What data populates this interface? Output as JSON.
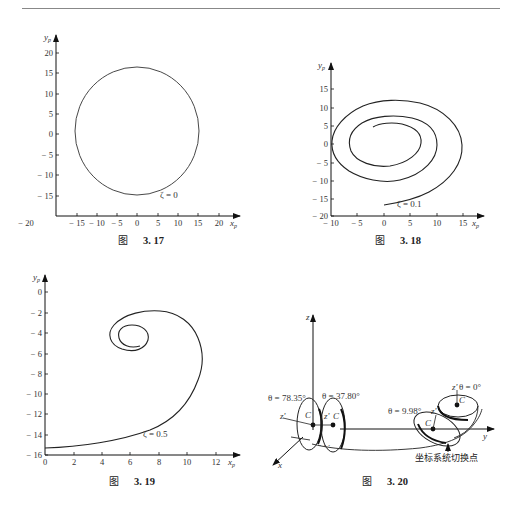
{
  "page": {
    "header_text": "",
    "figures": [
      {
        "id": "fig-3-17",
        "caption_prefix": "图",
        "caption_number": "3. 17"
      },
      {
        "id": "fig-3-18",
        "caption_prefix": "图",
        "caption_number": "3. 18"
      },
      {
        "id": "fig-3-19",
        "caption_prefix": "图",
        "caption_number": "3. 19"
      },
      {
        "id": "fig-3-20",
        "caption_prefix": "图",
        "caption_number": "3. 20"
      }
    ]
  },
  "chart_data": [
    {
      "type": "line",
      "title": "图 3.17",
      "xlabel": "x_p",
      "ylabel": "y_p",
      "annotation": "ζ = 0",
      "xlim": [
        -20,
        22
      ],
      "ylim": [
        -20,
        22
      ],
      "x_ticks": [
        "-20",
        "-15",
        "-10",
        "-5",
        "0",
        "5",
        "10",
        "15",
        "20"
      ],
      "y_ticks": [
        "20",
        "15",
        "10",
        "5",
        "0",
        "-5",
        "-10",
        "-15"
      ],
      "grid": false,
      "series": [
        {
          "name": "ζ=0",
          "shape": "closed circle",
          "center": [
            0,
            1
          ],
          "radius_x": 15.2,
          "radius_y": 15.6,
          "x": [
            0,
            10.7,
            15,
            10.7,
            0,
            -10.7,
            -15.2,
            -10.7,
            0
          ],
          "y": [
            16.5,
            12,
            1,
            -10.5,
            -14.5,
            -10.5,
            1,
            12,
            16.5
          ]
        }
      ]
    },
    {
      "type": "line",
      "title": "图 3.18",
      "xlabel": "x_p",
      "ylabel": "y_p",
      "annotation": "ζ = 0.1",
      "xlim": [
        -10,
        17
      ],
      "ylim": [
        -20,
        18
      ],
      "x_ticks": [
        "-10",
        "-5",
        "0",
        "5",
        "10",
        "15"
      ],
      "y_ticks": [
        "15",
        "10",
        "5",
        "0",
        "-5",
        "-10",
        "-15",
        "-20"
      ],
      "grid": false,
      "series": [
        {
          "name": "ζ=0.1",
          "shape": "outward spiral",
          "x": [
            -2,
            1.5,
            6,
            7,
            5,
            0.5,
            -4,
            -6.5,
            -5,
            0,
            5,
            9,
            10,
            7,
            0.5,
            -6.5,
            -10,
            -9,
            -2,
            2,
            9,
            14,
            15,
            12,
            5,
            0.5
          ],
          "y": [
            4.5,
            5.5,
            3,
            0,
            -4,
            -6,
            -5,
            0.5,
            4.5,
            7.5,
            7,
            4,
            0,
            -5.5,
            -9.5,
            -7.5,
            0,
            5,
            10.5,
            12,
            10.5,
            5,
            -2,
            -9,
            -13.5,
            -15
          ]
        }
      ]
    },
    {
      "type": "line",
      "title": "图 3.19",
      "xlabel": "x_p",
      "ylabel": "y_p",
      "annotation": "ζ = 0.5",
      "xlim": [
        0,
        13
      ],
      "ylim": [
        -16,
        1
      ],
      "x_ticks": [
        "0",
        "2",
        "4",
        "6",
        "8",
        "10",
        "12"
      ],
      "y_ticks": [
        "0",
        "-2",
        "-4",
        "-6",
        "-8",
        "-10",
        "-12",
        "-14",
        "-16"
      ],
      "grid": false,
      "series": [
        {
          "name": "ζ=0.5",
          "shape": "converging spiral",
          "x": [
            0,
            3,
            6,
            8,
            9.5,
            10.5,
            11,
            10.8,
            10,
            8,
            6,
            4.5,
            4.6,
            5.5,
            6.5,
            7,
            6,
            5.2,
            5.4,
            6.2,
            7.2,
            7.1,
            6.2
          ],
          "y": [
            -15.3,
            -15,
            -14.3,
            -13,
            -11.2,
            -8.8,
            -6.5,
            -4.8,
            -3.3,
            -2,
            -2.1,
            -3.7,
            -5,
            -5.6,
            -5.6,
            -4.5,
            -3.5,
            -4,
            -5.2,
            -5.5,
            -4.8,
            -3.9,
            -3.4
          ]
        }
      ]
    },
    {
      "type": "diagram",
      "title": "图 3.20",
      "axes": [
        "x",
        "y",
        "z"
      ],
      "annotations": [
        {
          "label": "θ = 78.35°"
        },
        {
          "label": "θ = 37.80°"
        },
        {
          "label": "θ = 9.98°"
        },
        {
          "label": "θ = 0°"
        },
        {
          "label": "z'"
        },
        {
          "label": "C"
        },
        {
          "label": "坐标系统切换点"
        }
      ]
    }
  ],
  "fig17": {
    "xlabel": "x",
    "xsub": "p",
    "ylabel": "y",
    "ysub": "p",
    "zeta": "ζ = 0",
    "xticks": [
      {
        "v": "− 20",
        "x": 26
      },
      {
        "v": "− 15",
        "x": 77
      },
      {
        "v": "− 10",
        "x": 97
      },
      {
        "v": "− 5",
        "x": 117
      },
      {
        "v": "0",
        "x": 137
      },
      {
        "v": "5",
        "x": 158
      },
      {
        "v": "10",
        "x": 178
      },
      {
        "v": "15",
        "x": 198
      },
      {
        "v": "20",
        "x": 219
      }
    ],
    "yticks": [
      {
        "v": "20",
        "y": 53
      },
      {
        "v": "15",
        "y": 73
      },
      {
        "v": "10",
        "y": 94
      },
      {
        "v": "5",
        "y": 114
      },
      {
        "v": "0",
        "y": 134
      },
      {
        "v": "− 5",
        "y": 155
      },
      {
        "v": "− 10",
        "y": 175
      },
      {
        "v": "− 15",
        "y": 196
      }
    ]
  },
  "fig18": {
    "xlabel": "x",
    "xsub": "p",
    "ylabel": "y",
    "ysub": "p",
    "zeta": "ζ = 0.1",
    "xticks": [
      {
        "v": "− 10",
        "x": 331
      },
      {
        "v": "− 5",
        "x": 357
      },
      {
        "v": "0",
        "x": 384
      },
      {
        "v": "5",
        "x": 410
      },
      {
        "v": "10",
        "x": 437
      },
      {
        "v": "15",
        "x": 463
      }
    ],
    "yticks": [
      {
        "v": "15",
        "y": 89
      },
      {
        "v": "10",
        "y": 108
      },
      {
        "v": "5",
        "y": 126
      },
      {
        "v": "0",
        "y": 144
      },
      {
        "v": "− 5",
        "y": 163
      },
      {
        "v": "− 10",
        "y": 181
      },
      {
        "v": "− 15",
        "y": 199
      },
      {
        "v": "− 20",
        "y": 216
      }
    ]
  },
  "fig19": {
    "xlabel": "x",
    "xsub": "p",
    "ylabel": "y",
    "ysub": "p",
    "zeta": "ζ = 0.5",
    "xticks": [
      {
        "v": "0",
        "x": 45
      },
      {
        "v": "2",
        "x": 74
      },
      {
        "v": "4",
        "x": 102
      },
      {
        "v": "6",
        "x": 130
      },
      {
        "v": "8",
        "x": 159
      },
      {
        "v": "10",
        "x": 187
      },
      {
        "v": "12",
        "x": 216
      }
    ],
    "yticks": [
      {
        "v": "0",
        "y": 292
      },
      {
        "v": "− 2",
        "y": 313
      },
      {
        "v": "− 4",
        "y": 333
      },
      {
        "v": "− 6",
        "y": 354
      },
      {
        "v": "− 8",
        "y": 374
      },
      {
        "v": "− 10",
        "y": 394
      },
      {
        "v": "− 12",
        "y": 414
      },
      {
        "v": "− 14",
        "y": 435
      },
      {
        "v": "− 16",
        "y": 455
      }
    ]
  },
  "fig20": {
    "z_axis": "z",
    "y_axis": "y",
    "x_axis": "x",
    "theta1": "θ = 78.35°",
    "theta2": "θ = 37.80°",
    "theta3": "θ = 9.98°",
    "theta4": "θ = 0°",
    "zprime": "z'",
    "c": "C",
    "switch_point": "坐标系统切换点"
  }
}
